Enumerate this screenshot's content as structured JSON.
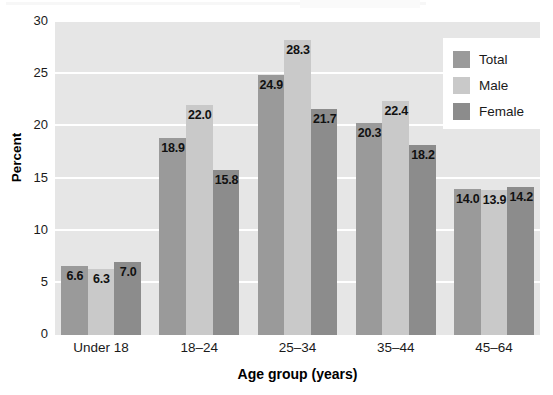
{
  "chart_data": {
    "type": "bar",
    "title": "",
    "xlabel": "Age group (years)",
    "ylabel": "Percent",
    "ylim": [
      0,
      30
    ],
    "yticks": [
      0,
      5,
      10,
      15,
      20,
      25,
      30
    ],
    "grid": true,
    "legend_position": "top-right",
    "categories": [
      "Under 18",
      "18–24",
      "25–34",
      "35–44",
      "45–64"
    ],
    "series": [
      {
        "name": "Total",
        "color": "#9a9a9a",
        "values": [
          6.6,
          18.9,
          24.9,
          20.3,
          14.0
        ]
      },
      {
        "name": "Male",
        "color": "#c9c9c9",
        "values": [
          6.3,
          22.0,
          28.3,
          22.4,
          13.9
        ]
      },
      {
        "name": "Female",
        "color": "#8c8c8c",
        "values": [
          7.0,
          15.8,
          21.7,
          18.2,
          14.2
        ]
      }
    ],
    "value_labels": [
      [
        "6.6",
        "6.3",
        "7.0"
      ],
      [
        "18.9",
        "22.0",
        "15.8"
      ],
      [
        "24.9",
        "28.3",
        "21.7"
      ],
      [
        "20.3",
        "22.4",
        "18.2"
      ],
      [
        "14.0",
        "13.9",
        "14.2"
      ]
    ]
  },
  "colors": {
    "plot_background": "#e6e6e6",
    "gridline": "#ffffff",
    "page_background": "#ffffff",
    "text": "#1a1a1a"
  }
}
